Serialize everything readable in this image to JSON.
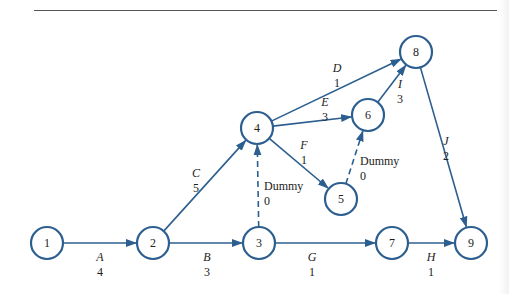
{
  "diagram": {
    "type": "activity-on-arrow project network",
    "colors": {
      "stroke": "#2c5f8f",
      "text": "#222222"
    },
    "nodes": [
      {
        "id": "1",
        "label": "1",
        "x": 47,
        "y": 243
      },
      {
        "id": "2",
        "label": "2",
        "x": 153,
        "y": 243
      },
      {
        "id": "3",
        "label": "3",
        "x": 259,
        "y": 243
      },
      {
        "id": "4",
        "label": "4",
        "x": 257,
        "y": 128
      },
      {
        "id": "5",
        "label": "5",
        "x": 341,
        "y": 199
      },
      {
        "id": "6",
        "label": "6",
        "x": 368,
        "y": 115
      },
      {
        "id": "7",
        "label": "7",
        "x": 392,
        "y": 243
      },
      {
        "id": "8",
        "label": "8",
        "x": 416,
        "y": 52
      },
      {
        "id": "9",
        "label": "9",
        "x": 471,
        "y": 243
      }
    ],
    "edges": [
      {
        "from": "1",
        "to": "2",
        "activity": "A",
        "duration": "4",
        "dummy": false,
        "lx": 100,
        "ly": 261
      },
      {
        "from": "2",
        "to": "3",
        "activity": "B",
        "duration": "3",
        "dummy": false,
        "lx": 207,
        "ly": 261
      },
      {
        "from": "2",
        "to": "4",
        "activity": "C",
        "duration": "5",
        "dummy": false,
        "lx": 196,
        "ly": 177
      },
      {
        "from": "3",
        "to": "4",
        "activity": "Dummy",
        "duration": "0",
        "dummy": true,
        "lx": 264,
        "ly": 190
      },
      {
        "from": "4",
        "to": "8",
        "activity": "D",
        "duration": "1",
        "dummy": false,
        "lx": 337,
        "ly": 72
      },
      {
        "from": "4",
        "to": "6",
        "activity": "E",
        "duration": "3",
        "dummy": false,
        "lx": 325,
        "ly": 106
      },
      {
        "from": "4",
        "to": "5",
        "activity": "F",
        "duration": "1",
        "dummy": false,
        "lx": 304,
        "ly": 149
      },
      {
        "from": "5",
        "to": "6",
        "activity": "Dummy",
        "duration": "0",
        "dummy": true,
        "lx": 360,
        "ly": 165
      },
      {
        "from": "6",
        "to": "8",
        "activity": "I",
        "duration": "3",
        "dummy": false,
        "lx": 400,
        "ly": 88
      },
      {
        "from": "8",
        "to": "9",
        "activity": "J",
        "duration": "2",
        "dummy": false,
        "lx": 446,
        "ly": 145
      },
      {
        "from": "3",
        "to": "7",
        "activity": "G",
        "duration": "1",
        "dummy": false,
        "lx": 312,
        "ly": 261
      },
      {
        "from": "7",
        "to": "9",
        "activity": "H",
        "duration": "1",
        "dummy": false,
        "lx": 431,
        "ly": 261
      }
    ]
  }
}
